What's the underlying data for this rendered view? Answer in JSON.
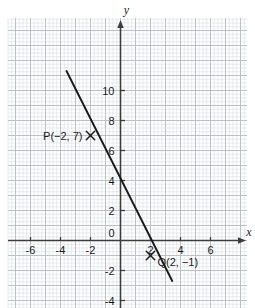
{
  "figure": {
    "kind": "coordinate-plane-line-graph",
    "background": "#ffffff",
    "grid_minor_color": "#d9dde3",
    "grid_major_color": "#b7bcc4",
    "axis_color": "#3c3c3c",
    "line_color": "#1a1a1a",
    "text_color": "#1a1a1a"
  },
  "axes": {
    "x_name": "x",
    "y_name": "y",
    "origin_label": "0",
    "x_ticks": [
      {
        "value": -6,
        "label": "-6"
      },
      {
        "value": -4,
        "label": "-4"
      },
      {
        "value": -2,
        "label": "-2"
      },
      {
        "value": 2,
        "label": "2"
      },
      {
        "value": 4,
        "label": "4"
      },
      {
        "value": 6,
        "label": "6"
      }
    ],
    "y_ticks": [
      {
        "value": 10,
        "label": "10"
      },
      {
        "value": 8,
        "label": "8"
      },
      {
        "value": 6,
        "label": "6"
      },
      {
        "value": 4,
        "label": "4"
      },
      {
        "value": 2,
        "label": "2"
      },
      {
        "value": -2,
        "label": "-2"
      },
      {
        "value": -4,
        "label": "-4"
      }
    ]
  },
  "chart_data": {
    "type": "line",
    "title": "",
    "xlabel": "x",
    "ylabel": "y",
    "xlim": [
      -7.5,
      8.5
    ],
    "ylim": [
      -4.5,
      14.8
    ],
    "grid": true,
    "legend": "none",
    "series": [
      {
        "name": "line through P and Q",
        "equation": "y = -2x + 3",
        "slope": -2,
        "y_intercept": 3,
        "endpoints": [
          {
            "x": -3.6,
            "y": 11.3
          },
          {
            "x": 3.45,
            "y": -2.7
          }
        ]
      }
    ],
    "points": [
      {
        "name": "P",
        "x": -2,
        "y": 7,
        "marker": "x",
        "label": "P(−2, 7)",
        "label_side": "left"
      },
      {
        "name": "Q",
        "x": 2,
        "y": -1,
        "marker": "x",
        "label": "Q(2, −1)",
        "label_side": "right"
      }
    ],
    "x_tick_values": [
      -6,
      -4,
      -2,
      0,
      2,
      4,
      6
    ],
    "y_tick_values": [
      10,
      8,
      6,
      4,
      2,
      0,
      -2,
      -4
    ]
  }
}
